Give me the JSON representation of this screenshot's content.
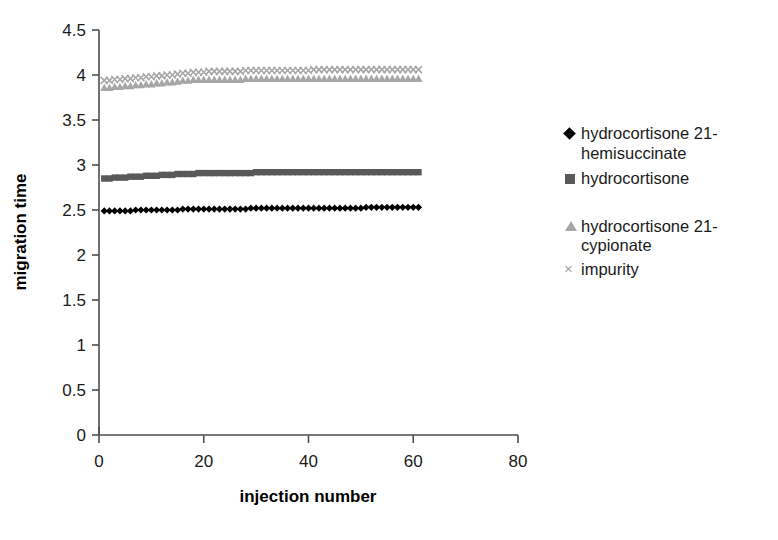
{
  "chart_data": {
    "type": "scatter",
    "title": "",
    "xlabel": "injection number",
    "ylabel": "migration time",
    "xlim": [
      0,
      80
    ],
    "ylim": [
      0,
      4.5
    ],
    "xticks": [
      0,
      20,
      40,
      60,
      80
    ],
    "yticks": [
      0,
      0.5,
      1,
      1.5,
      2,
      2.5,
      3,
      3.5,
      4,
      4.5
    ],
    "xtick_labels": [
      "0",
      "20",
      "40",
      "60",
      "80"
    ],
    "ytick_labels": [
      "0",
      "0.5",
      "1",
      "1.5",
      "2",
      "2.5",
      "3",
      "3.5",
      "4",
      "4.5"
    ],
    "grid": false,
    "legend_position": "right",
    "x": [
      1,
      2,
      3,
      4,
      5,
      6,
      7,
      8,
      9,
      10,
      11,
      12,
      13,
      14,
      15,
      16,
      17,
      18,
      19,
      20,
      21,
      22,
      23,
      24,
      25,
      26,
      27,
      28,
      29,
      30,
      31,
      32,
      33,
      34,
      35,
      36,
      37,
      38,
      39,
      40,
      41,
      42,
      43,
      44,
      45,
      46,
      47,
      48,
      49,
      50,
      51,
      52,
      53,
      54,
      55,
      56,
      57,
      58,
      59,
      60,
      61
    ],
    "series": [
      {
        "name": "hydrocortisone 21-hemisuccinate",
        "marker": "diamond",
        "color": "#000000",
        "values": [
          2.49,
          2.49,
          2.49,
          2.49,
          2.49,
          2.49,
          2.5,
          2.5,
          2.5,
          2.5,
          2.5,
          2.5,
          2.5,
          2.5,
          2.5,
          2.51,
          2.51,
          2.51,
          2.51,
          2.51,
          2.51,
          2.51,
          2.51,
          2.51,
          2.51,
          2.51,
          2.51,
          2.51,
          2.52,
          2.52,
          2.52,
          2.52,
          2.52,
          2.52,
          2.52,
          2.52,
          2.52,
          2.52,
          2.52,
          2.52,
          2.52,
          2.52,
          2.52,
          2.52,
          2.52,
          2.52,
          2.52,
          2.52,
          2.52,
          2.52,
          2.53,
          2.53,
          2.53,
          2.53,
          2.53,
          2.53,
          2.53,
          2.53,
          2.53,
          2.53,
          2.53
        ]
      },
      {
        "name": "hydrocortisone",
        "marker": "square",
        "color": "#595959",
        "values": [
          2.85,
          2.85,
          2.86,
          2.86,
          2.86,
          2.87,
          2.87,
          2.87,
          2.88,
          2.88,
          2.88,
          2.89,
          2.89,
          2.89,
          2.9,
          2.9,
          2.9,
          2.9,
          2.91,
          2.91,
          2.91,
          2.91,
          2.91,
          2.91,
          2.91,
          2.91,
          2.91,
          2.91,
          2.91,
          2.92,
          2.92,
          2.92,
          2.92,
          2.92,
          2.92,
          2.92,
          2.92,
          2.92,
          2.92,
          2.92,
          2.92,
          2.92,
          2.92,
          2.92,
          2.92,
          2.92,
          2.92,
          2.92,
          2.92,
          2.92,
          2.92,
          2.92,
          2.92,
          2.92,
          2.92,
          2.92,
          2.92,
          2.92,
          2.92,
          2.92,
          2.92
        ]
      },
      {
        "name": "hydrocortisone 21-cypionate",
        "marker": "triangle",
        "color": "#a6a6a6",
        "values": [
          3.86,
          3.86,
          3.87,
          3.87,
          3.88,
          3.88,
          3.89,
          3.89,
          3.9,
          3.9,
          3.91,
          3.91,
          3.92,
          3.92,
          3.93,
          3.94,
          3.94,
          3.95,
          3.95,
          3.95,
          3.95,
          3.95,
          3.95,
          3.95,
          3.95,
          3.95,
          3.95,
          3.96,
          3.96,
          3.96,
          3.96,
          3.96,
          3.96,
          3.96,
          3.96,
          3.96,
          3.96,
          3.96,
          3.96,
          3.96,
          3.96,
          3.96,
          3.96,
          3.96,
          3.96,
          3.96,
          3.96,
          3.96,
          3.96,
          3.96,
          3.96,
          3.96,
          3.96,
          3.96,
          3.96,
          3.96,
          3.96,
          3.96,
          3.96,
          3.96,
          3.96
        ]
      },
      {
        "name": "impurity",
        "marker": "cross",
        "color": "#a6a6a6",
        "values": [
          3.94,
          3.94,
          3.95,
          3.95,
          3.96,
          3.96,
          3.97,
          3.97,
          3.98,
          3.98,
          3.99,
          3.99,
          4.0,
          4.0,
          4.01,
          4.02,
          4.02,
          4.03,
          4.03,
          4.03,
          4.04,
          4.04,
          4.04,
          4.04,
          4.04,
          4.04,
          4.04,
          4.05,
          4.05,
          4.05,
          4.05,
          4.05,
          4.05,
          4.05,
          4.05,
          4.05,
          4.05,
          4.05,
          4.05,
          4.05,
          4.06,
          4.06,
          4.06,
          4.06,
          4.06,
          4.06,
          4.06,
          4.06,
          4.06,
          4.06,
          4.06,
          4.06,
          4.06,
          4.06,
          4.06,
          4.06,
          4.06,
          4.06,
          4.06,
          4.06,
          4.06
        ]
      }
    ]
  },
  "axes": {
    "x_title": "injection number",
    "y_title": "migration time"
  },
  "legend": {
    "entries": [
      {
        "marker": "diamond-marker",
        "label": "hydrocortisone 21-\nhemisuccinate"
      },
      {
        "marker": "square-marker",
        "label": "hydrocortisone"
      },
      {
        "marker": "triangle-marker",
        "label": "hydrocortisone 21-\ncypionate"
      },
      {
        "marker": "cross-marker",
        "label": "impurity"
      }
    ]
  },
  "colors": {
    "series_1": "#000000",
    "series_2": "#595959",
    "series_3": "#a6a6a6",
    "series_4": "#a6a6a6",
    "axis": "#4d4d4d",
    "background": "#ffffff"
  }
}
